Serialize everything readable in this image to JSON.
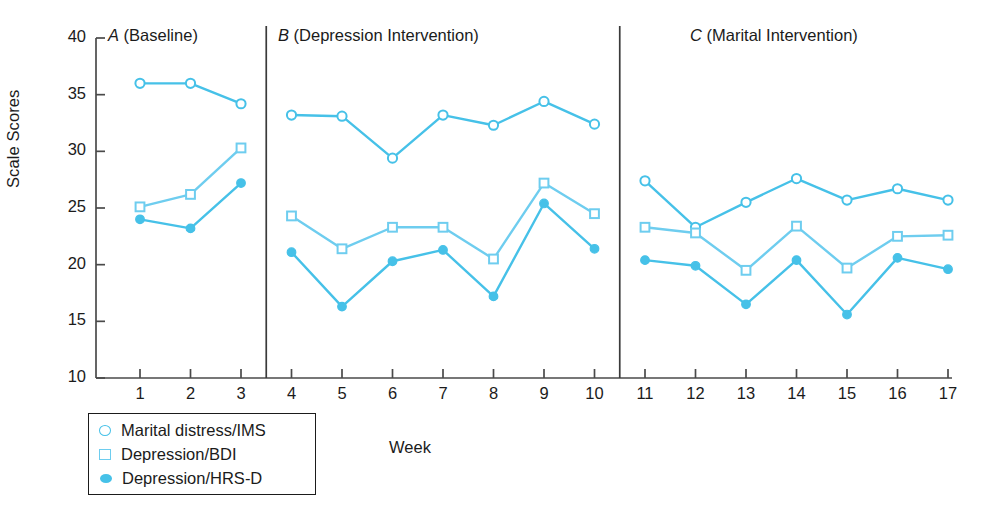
{
  "chart_data": {
    "type": "line",
    "title": "",
    "xlabel": "Week",
    "ylabel": "Scale Scores",
    "ylim": [
      10,
      40
    ],
    "yticks": [
      10,
      15,
      20,
      25,
      30,
      35,
      40
    ],
    "xlim": [
      0.4,
      17.6
    ],
    "xticks": [
      1,
      2,
      3,
      4,
      5,
      6,
      7,
      8,
      9,
      10,
      11,
      12,
      13,
      14,
      15,
      16,
      17
    ],
    "grid": false,
    "legend_position": "below-left",
    "x": [
      1,
      2,
      3,
      4,
      5,
      6,
      7,
      8,
      9,
      10,
      11,
      12,
      13,
      14,
      15,
      16,
      17
    ],
    "phases": [
      {
        "id": "A",
        "label": "A (Baseline)",
        "letter": "A",
        "rest": " (Baseline)",
        "weeks": [
          1,
          2,
          3
        ]
      },
      {
        "id": "B",
        "label": "B (Depression Intervention)",
        "letter": "B",
        "rest": " (Depression Intervention)",
        "weeks": [
          4,
          5,
          6,
          7,
          8,
          9,
          10
        ]
      },
      {
        "id": "C",
        "label": "C (Marital Intervention)",
        "letter": "C",
        "rest": " (Marital Intervention)",
        "weeks": [
          11,
          12,
          13,
          14,
          15,
          16,
          17
        ]
      }
    ],
    "phase_separators": [
      3.5,
      10.5
    ],
    "series": [
      {
        "name": "Marital distress/IMS",
        "marker": "open-circle",
        "color": "#46c1e8",
        "values": [
          36.0,
          36.0,
          34.2,
          33.2,
          33.1,
          29.4,
          33.2,
          32.3,
          34.4,
          32.4,
          27.4,
          23.3,
          25.5,
          27.6,
          25.7,
          26.7,
          25.7
        ]
      },
      {
        "name": "Depression/BDI",
        "marker": "open-square",
        "color": "#6ecdef",
        "values": [
          25.1,
          26.2,
          30.3,
          24.3,
          21.4,
          23.3,
          23.3,
          20.5,
          27.2,
          24.5,
          23.3,
          22.8,
          19.5,
          23.4,
          19.7,
          22.5,
          22.6
        ]
      },
      {
        "name": "Depression/HRS-D",
        "marker": "filled-circle",
        "color": "#46c1e8",
        "values": [
          24.0,
          23.2,
          27.2,
          21.1,
          16.3,
          20.3,
          21.3,
          17.2,
          25.4,
          21.4,
          20.4,
          19.9,
          16.5,
          20.4,
          15.6,
          20.6,
          19.6
        ]
      }
    ],
    "legend": [
      {
        "label": "Marital distress/IMS",
        "marker": "open-circle"
      },
      {
        "label": "Depression/BDI",
        "marker": "open-square"
      },
      {
        "label": "Depression/HRS-D",
        "marker": "filled-circle"
      }
    ],
    "axis_color": "#4a4a4a",
    "text_color": "#1b1b1b"
  }
}
